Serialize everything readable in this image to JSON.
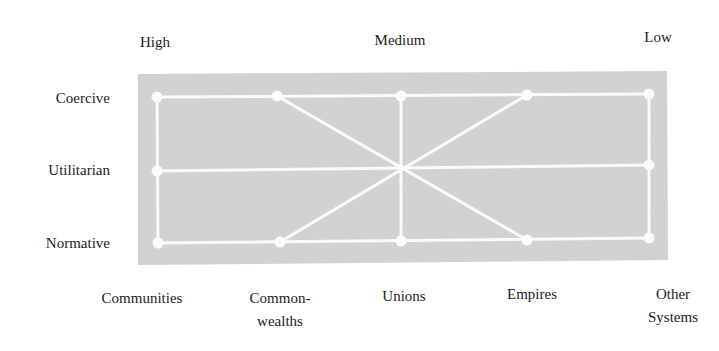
{
  "diagram": {
    "header_labels": [
      {
        "label": "High",
        "x": 155,
        "y": 32
      },
      {
        "label": "Medium",
        "x": 400,
        "y": 30
      },
      {
        "label": "Low",
        "x": 658,
        "y": 27
      }
    ],
    "row_labels": [
      {
        "label": "Coercive",
        "y": 90
      },
      {
        "label": "Utilitarian",
        "y": 162
      },
      {
        "label": "Normative",
        "y": 235
      }
    ],
    "column_labels": [
      {
        "lines": [
          "Communities"
        ],
        "x": 142,
        "y": 289
      },
      {
        "lines": [
          "Common-",
          "wealths"
        ],
        "x": 280,
        "y": 287
      },
      {
        "lines": [
          "Unions"
        ],
        "x": 404,
        "y": 287
      },
      {
        "lines": [
          "Empires"
        ],
        "x": 532,
        "y": 285
      },
      {
        "lines": [
          "Other",
          "Systems"
        ],
        "x": 673,
        "y": 283
      }
    ],
    "panel": {
      "fill": "#cfcfcf",
      "line_color": "#fafafa"
    },
    "points": {
      "coercive": [
        [
          157,
          97
        ],
        [
          277,
          96
        ],
        [
          401,
          96
        ],
        [
          527,
          95
        ],
        [
          649,
          94
        ]
      ],
      "utilitarian": [
        [
          157,
          171
        ],
        [
          649,
          165
        ]
      ],
      "normative": [
        [
          158,
          243
        ],
        [
          280,
          242
        ],
        [
          401,
          241
        ],
        [
          527,
          240
        ],
        [
          649,
          238
        ]
      ]
    },
    "connections": [
      {
        "from": "Coercive-High",
        "to": "Coercive-Low"
      },
      {
        "from": "Normative-High",
        "to": "Normative-Low"
      },
      {
        "from": "Utilitarian-High",
        "to": "Utilitarian-Low"
      },
      {
        "from": "Coercive-High",
        "to": "Normative-High"
      },
      {
        "from": "Coercive-Low",
        "to": "Normative-Low"
      },
      {
        "from": "Coercive-Unions",
        "to": "Normative-Unions"
      },
      {
        "from": "Coercive-Commonwealths",
        "to": "Normative-Empires"
      },
      {
        "from": "Coercive-Empires",
        "to": "Normative-Commonwealths"
      }
    ]
  }
}
